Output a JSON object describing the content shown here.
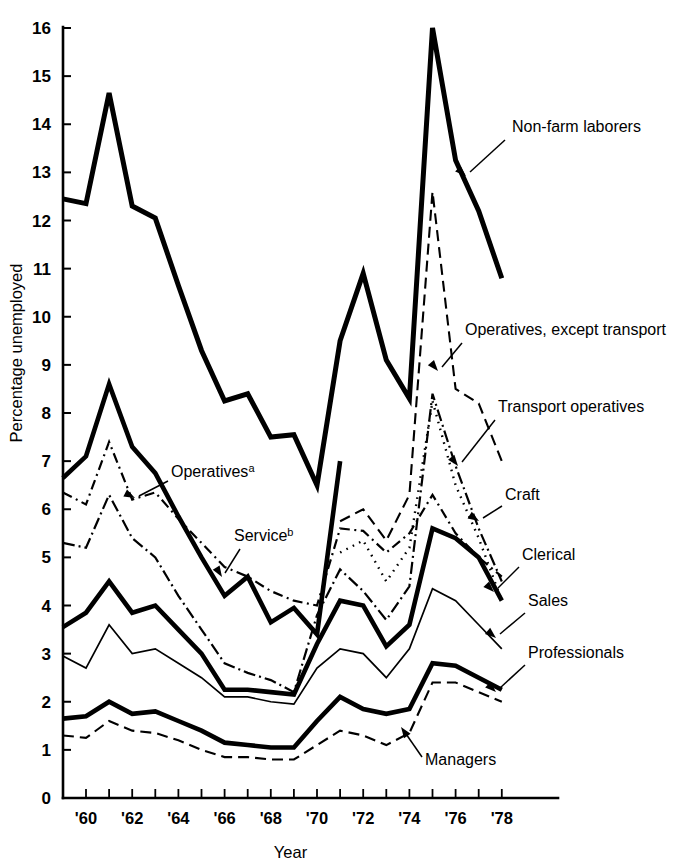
{
  "chart_data": {
    "type": "line",
    "title": "",
    "xlabel": "Year",
    "ylabel": "Percentage unemployed",
    "xlim": [
      1959,
      1979
    ],
    "ylim": [
      0,
      16
    ],
    "grid": false,
    "legend_position": "inline-annotations",
    "x": [
      1959,
      1960,
      1961,
      1962,
      1963,
      1964,
      1965,
      1966,
      1967,
      1968,
      1969,
      1970,
      1971,
      1972,
      1973,
      1974,
      1975,
      1976,
      1977,
      1978
    ],
    "y_ticks": [
      0,
      1,
      2,
      3,
      4,
      5,
      6,
      7,
      8,
      9,
      10,
      11,
      12,
      13,
      14,
      15,
      16
    ],
    "y_tick_labels": [
      "0",
      "1",
      "2",
      "3",
      "4",
      "5",
      "6",
      "7",
      "8",
      "9",
      "10",
      "11",
      "12",
      "13",
      "14",
      "15",
      "16"
    ],
    "x_ticks": [
      1960,
      1961,
      1962,
      1963,
      1964,
      1965,
      1966,
      1967,
      1968,
      1969,
      1970,
      1971,
      1972,
      1973,
      1974,
      1975,
      1976,
      1977,
      1978
    ],
    "x_tick_labels": [
      "'60",
      "",
      "'62",
      "",
      "'64",
      "",
      "'66",
      "",
      "'68",
      "",
      "'70",
      "",
      "'72",
      "",
      "'74",
      "",
      "'76",
      "",
      "'78"
    ],
    "series": [
      {
        "name": "Non-farm laborers",
        "style": "solid-thick",
        "stroke_width": 5.0,
        "dash": "none",
        "x": [
          1959,
          1960,
          1961,
          1962,
          1963,
          1964,
          1965,
          1966,
          1967,
          1968,
          1969,
          1970,
          1971,
          1972,
          1973,
          1974,
          1975,
          1976,
          1977,
          1978
        ],
        "values": [
          12.45,
          12.35,
          14.65,
          12.3,
          12.05,
          10.65,
          9.3,
          8.25,
          8.4,
          7.5,
          7.55,
          6.5,
          9.5,
          10.9,
          9.1,
          8.3,
          16.0,
          13.25,
          12.2,
          10.8
        ]
      },
      {
        "name": "Operatives, except transport",
        "style": "dashed",
        "stroke_width": 2.1,
        "dash": "11,6",
        "x": [
          1971,
          1972,
          1973,
          1974,
          1975,
          1976,
          1977,
          1978
        ],
        "values": [
          5.75,
          6.0,
          5.35,
          6.3,
          12.6,
          8.5,
          8.2,
          7.0
        ]
      },
      {
        "name": "Transport operatives",
        "style": "dotted",
        "stroke_width": 2.4,
        "dash": "1.6,5.5",
        "x": [
          1971,
          1972,
          1973,
          1974,
          1975,
          1976,
          1977,
          1978
        ],
        "values": [
          5.1,
          5.35,
          4.5,
          5.2,
          8.25,
          6.5,
          5.4,
          4.1
        ]
      },
      {
        "name": "Operatives",
        "style": "solid-thick",
        "stroke_width": 4.6,
        "dash": "none",
        "x": [
          1959,
          1960,
          1961,
          1962,
          1963,
          1964,
          1965,
          1966,
          1967,
          1968,
          1969,
          1970,
          1971
        ],
        "values": [
          6.65,
          7.1,
          8.6,
          7.3,
          6.75,
          5.85,
          5.0,
          4.2,
          4.6,
          3.65,
          3.95,
          3.4,
          7.0
        ]
      },
      {
        "name": "Service",
        "style": "dash-dot",
        "stroke_width": 2.2,
        "dash": "10,4.5,2,4.5",
        "x": [
          1959,
          1960,
          1961,
          1962,
          1963,
          1964,
          1965,
          1966,
          1967,
          1968,
          1969,
          1970,
          1971,
          1972,
          1973,
          1974,
          1975,
          1976,
          1977,
          1978
        ],
        "values": [
          6.35,
          6.1,
          7.4,
          6.2,
          6.35,
          5.8,
          5.3,
          4.8,
          4.6,
          4.3,
          4.1,
          4.0,
          5.6,
          5.55,
          5.1,
          5.5,
          6.3,
          5.5,
          5.0,
          4.6
        ]
      },
      {
        "name": "Craft",
        "style": "dash-dot",
        "stroke_width": 2.2,
        "dash": "12,4,2,4",
        "x": [
          1959,
          1960,
          1961,
          1962,
          1963,
          1964,
          1965,
          1966,
          1967,
          1968,
          1969,
          1970,
          1971,
          1972,
          1973,
          1974,
          1975,
          1976,
          1977,
          1978
        ],
        "values": [
          5.3,
          5.2,
          6.3,
          5.4,
          5.0,
          4.2,
          3.5,
          2.8,
          2.6,
          2.45,
          2.2,
          3.8,
          4.75,
          4.3,
          3.7,
          4.4,
          8.4,
          6.9,
          5.6,
          4.5
        ]
      },
      {
        "name": "Clerical",
        "style": "solid-thick",
        "stroke_width": 4.6,
        "dash": "none",
        "x": [
          1959,
          1960,
          1961,
          1962,
          1963,
          1964,
          1965,
          1966,
          1967,
          1968,
          1969,
          1970,
          1971,
          1972,
          1973,
          1974,
          1975,
          1976,
          1977,
          1978
        ],
        "values": [
          3.55,
          3.85,
          4.5,
          3.85,
          4.0,
          3.5,
          3.0,
          2.25,
          2.25,
          2.2,
          2.15,
          3.2,
          4.1,
          4.0,
          3.15,
          3.6,
          5.6,
          5.4,
          5.0,
          4.1
        ]
      },
      {
        "name": "Sales",
        "style": "thin-solid",
        "stroke_width": 1.7,
        "dash": "none",
        "x": [
          1959,
          1960,
          1961,
          1962,
          1963,
          1964,
          1965,
          1966,
          1967,
          1968,
          1969,
          1970,
          1971,
          1972,
          1973,
          1974,
          1975,
          1976,
          1977,
          1978
        ],
        "values": [
          2.95,
          2.7,
          3.6,
          3.0,
          3.1,
          2.8,
          2.5,
          2.1,
          2.1,
          2.0,
          1.95,
          2.7,
          3.1,
          3.0,
          2.5,
          3.1,
          4.35,
          4.1,
          3.6,
          3.1
        ]
      },
      {
        "name": "Professionals",
        "style": "solid-thick",
        "stroke_width": 4.6,
        "dash": "none",
        "x": [
          1959,
          1960,
          1961,
          1962,
          1963,
          1964,
          1965,
          1966,
          1967,
          1968,
          1969,
          1970,
          1971,
          1972,
          1973,
          1974,
          1975,
          1976,
          1977,
          1978
        ],
        "values": [
          1.65,
          1.7,
          2.0,
          1.75,
          1.8,
          1.6,
          1.4,
          1.15,
          1.1,
          1.05,
          1.05,
          1.6,
          2.1,
          1.85,
          1.75,
          1.85,
          2.8,
          2.75,
          2.5,
          2.25
        ]
      },
      {
        "name": "Managers",
        "style": "dashed",
        "stroke_width": 2.1,
        "dash": "11,6",
        "x": [
          1959,
          1960,
          1961,
          1962,
          1963,
          1964,
          1965,
          1966,
          1967,
          1968,
          1969,
          1970,
          1971,
          1972,
          1973,
          1974,
          1975,
          1976,
          1977,
          1978
        ],
        "values": [
          1.3,
          1.25,
          1.6,
          1.4,
          1.35,
          1.2,
          1.0,
          0.85,
          0.85,
          0.8,
          0.8,
          1.1,
          1.4,
          1.3,
          1.1,
          1.35,
          2.4,
          2.4,
          2.2,
          2.0
        ]
      }
    ],
    "annotations": [
      {
        "id": "non-farm-laborers",
        "label": "Non-farm laborers",
        "superscript": "",
        "text_x": 512,
        "text_y": 132,
        "leader": "M505,140 L470,172",
        "arrow_x": 466,
        "arrow_y": 176,
        "arrow_angle": 222
      },
      {
        "id": "operatives-except-transport",
        "label": "Operatives, except transport",
        "superscript": "",
        "text_x": 465,
        "text_y": 335,
        "leader": "M462,343 L442,367",
        "arrow_x": 438,
        "arrow_y": 371,
        "arrow_angle": 230
      },
      {
        "id": "transport-operatives",
        "label": "Transport operatives",
        "superscript": "",
        "text_x": 498,
        "text_y": 412,
        "leader": "M495,420 L462,462",
        "arrow_x": 458,
        "arrow_y": 466,
        "arrow_angle": 232
      },
      {
        "id": "craft",
        "label": "Craft",
        "superscript": "",
        "text_x": 505,
        "text_y": 500,
        "leader": "M502,506 L483,518",
        "arrow_x": 479,
        "arrow_y": 521,
        "arrow_angle": 212
      },
      {
        "id": "clerical",
        "label": "Clerical",
        "superscript": "",
        "text_x": 522,
        "text_y": 560,
        "leader": "M519,567 L498,588",
        "arrow_x": 494,
        "arrow_y": 592,
        "arrow_angle": 225
      },
      {
        "id": "sales",
        "label": "Sales",
        "superscript": "",
        "text_x": 528,
        "text_y": 606,
        "leader": "M525,613 L500,634",
        "arrow_x": 496,
        "arrow_y": 638,
        "arrow_angle": 220
      },
      {
        "id": "professionals",
        "label": "Professionals",
        "superscript": "",
        "text_x": 528,
        "text_y": 658,
        "leader": "M525,665 L500,688",
        "arrow_x": 496,
        "arrow_y": 692,
        "arrow_angle": 222
      },
      {
        "id": "operatives",
        "label": "Operatives",
        "superscript": "a",
        "text_x": 171,
        "text_y": 477,
        "leader": "M168,481 L139,496",
        "arrow_x": 135,
        "arrow_y": 498,
        "arrow_angle": 207
      },
      {
        "id": "service",
        "label": "Service",
        "superscript": "b",
        "text_x": 234,
        "text_y": 541,
        "leader": "M240,549 L225,573",
        "arrow_x": 222,
        "arrow_y": 577,
        "arrow_angle": 238
      },
      {
        "id": "managers",
        "label": "Managers",
        "superscript": "",
        "text_x": 425,
        "text_y": 765,
        "leader": "M422,757 L404,731",
        "arrow_x": 401,
        "arrow_y": 727,
        "arrow_angle": 55
      }
    ]
  }
}
